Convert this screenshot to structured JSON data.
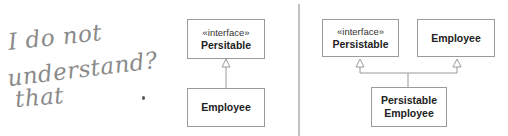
{
  "annotation": {
    "lines": [
      "I do not",
      "understand?",
      "that"
    ]
  },
  "left_diagram": {
    "interface_box": {
      "stereotype": "«interface»",
      "name": "Persitable"
    },
    "class_box": {
      "name": "Employee"
    },
    "relation": "realization"
  },
  "right_diagram": {
    "interface_box": {
      "stereotype": "«interface»",
      "name": "Persistable"
    },
    "class_box": {
      "name": "Employee"
    },
    "combined_box": {
      "name_line1": "Persistable",
      "name_line2": "Employee"
    },
    "relations": [
      "realization",
      "generalization"
    ]
  },
  "colors": {
    "pencil": "#8a8a8a",
    "box_border": "#9a9a9a",
    "divider": "#888888",
    "text": "#222222"
  }
}
